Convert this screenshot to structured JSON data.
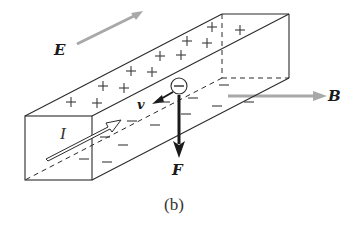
{
  "figure": {
    "caption": "(b)",
    "labels": {
      "E": "E",
      "B": "B",
      "I": "I",
      "v": "v",
      "F": "F"
    },
    "electron_symbol": "−",
    "plus_symbol": "+",
    "minus_symbol": "—",
    "colors": {
      "line": "#2b2b2b",
      "field_arrow": "#a8a8a8",
      "force_arrow": "#1a1a1a",
      "background": "#ffffff"
    },
    "plus_charges": [
      {
        "x": 71,
        "y": 102
      },
      {
        "x": 97,
        "y": 103
      },
      {
        "x": 103,
        "y": 86
      },
      {
        "x": 124,
        "y": 88
      },
      {
        "x": 131,
        "y": 71
      },
      {
        "x": 152,
        "y": 72
      },
      {
        "x": 160,
        "y": 56
      },
      {
        "x": 181,
        "y": 55
      },
      {
        "x": 187,
        "y": 41
      },
      {
        "x": 207,
        "y": 43
      },
      {
        "x": 212,
        "y": 27
      },
      {
        "x": 240,
        "y": 30
      }
    ],
    "minus_charges": [
      {
        "x": 224,
        "y": 85
      },
      {
        "x": 249,
        "y": 102
      },
      {
        "x": 193,
        "y": 98
      },
      {
        "x": 217,
        "y": 106
      },
      {
        "x": 165,
        "y": 102
      },
      {
        "x": 186,
        "y": 114
      },
      {
        "x": 132,
        "y": 121
      },
      {
        "x": 155,
        "y": 125
      },
      {
        "x": 105,
        "y": 137
      },
      {
        "x": 123,
        "y": 145
      },
      {
        "x": 84,
        "y": 159
      },
      {
        "x": 107,
        "y": 162
      }
    ]
  }
}
